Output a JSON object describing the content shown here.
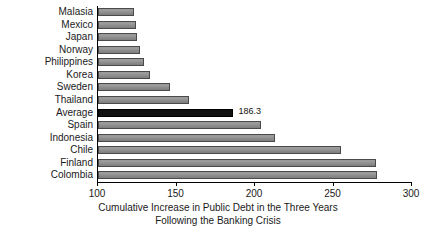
{
  "chart_data": {
    "type": "bar",
    "orientation": "horizontal",
    "title": "",
    "xlabel_line1": "Cumulative Increase in Public Debt in the Three Years",
    "xlabel_line2": "Following the Banking Crisis",
    "ylabel": "",
    "xlim": [
      100,
      300
    ],
    "xticks": [
      100,
      150,
      200,
      250,
      300
    ],
    "xtick_labels": [
      "100",
      "150",
      "200",
      "250",
      "300"
    ],
    "grid": false,
    "legend": "none",
    "categories": [
      "Malasia",
      "Mexico",
      "Japan",
      "Norway",
      "Philippines",
      "Korea",
      "Sweden",
      "Thailand",
      "Average",
      "Spain",
      "Indonesia",
      "Chile",
      "Finland",
      "Colombia"
    ],
    "values": [
      123.0,
      124.0,
      125.0,
      126.5,
      129.0,
      133.0,
      146.0,
      158.0,
      186.3,
      204.0,
      213.0,
      255.0,
      277.0,
      277.5
    ],
    "data_labels": [
      "",
      "",
      "",
      "",
      "",
      "",
      "",
      "",
      "186.3",
      "",
      "",
      "",
      "",
      ""
    ],
    "highlight_category": "Average",
    "colors": {
      "bar_fill": "#8e8e8e",
      "bar_edge": "#4a4a4a",
      "highlight_fill": "#111111",
      "axis": "#000000",
      "text": "#1a1a1a",
      "background": "#ffffff"
    }
  }
}
